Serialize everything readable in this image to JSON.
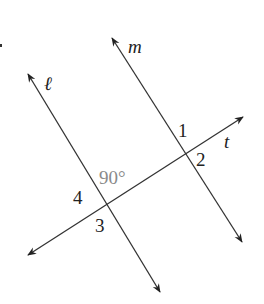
{
  "diagram": {
    "lines": [
      {
        "name": "ℓ",
        "from": [
          160,
          292
        ],
        "to": [
          28,
          74
        ],
        "arrows": "both"
      },
      {
        "name": "m",
        "from": [
          242,
          242
        ],
        "to": [
          112,
          38
        ],
        "arrows": "both"
      },
      {
        "name": "t",
        "from": [
          28,
          255
        ],
        "to": [
          243,
          117
        ],
        "arrows": "both"
      }
    ],
    "labels": {
      "line_l": "ℓ",
      "line_m": "m",
      "line_t": "t",
      "angle_1": "1",
      "angle_2": "2",
      "angle_3": "3",
      "angle_4": "4",
      "angle_given": "90°"
    },
    "colors": {
      "line": "#333333",
      "text": "#222222",
      "given_angle_text": "#8a8a8a",
      "background": "#ffffff"
    }
  }
}
